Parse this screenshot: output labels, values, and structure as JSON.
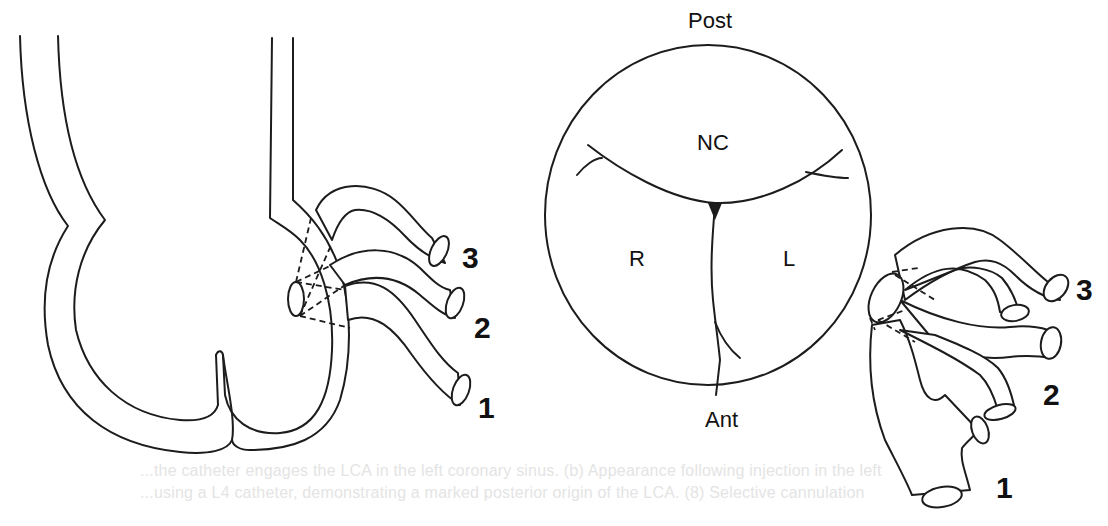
{
  "figure": {
    "left_panel": {
      "description": "Aortic root, lateral view, with three catheter positions",
      "tube_labels": [
        "1",
        "2",
        "3"
      ]
    },
    "right_panel": {
      "description": "Aortic valve viewed en face with LCA origin positions",
      "orientation_top": "Post",
      "orientation_bottom": "Ant",
      "cusps": {
        "noncoronary": "NC",
        "right": "R",
        "left": "L"
      },
      "tube_labels": [
        "1",
        "2",
        "3"
      ]
    },
    "caption_ghost": {
      "line1": "...the catheter engages the LCA in the left coronary sinus. (b) Appearance following injection in the left",
      "line2": "...using a L4 catheter, demonstrating a marked posterior origin of the LCA. (8) Selective cannulation"
    }
  },
  "colors": {
    "ink": "#1c1c1c",
    "background": "#ffffff",
    "ghost_text": "#e4e4e4"
  }
}
